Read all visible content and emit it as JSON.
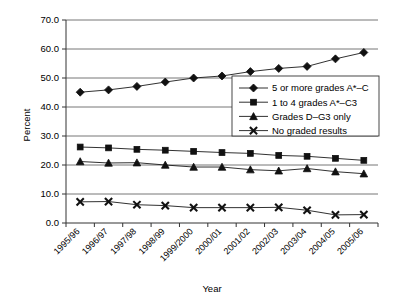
{
  "chart_data": {
    "type": "line",
    "title": "",
    "xlabel": "Year",
    "ylabel": "Percent",
    "ylim": [
      0,
      70
    ],
    "ytick_step": 10,
    "ytick_labels": [
      "0.0",
      "10.0",
      "20.0",
      "30.0",
      "40.0",
      "50.0",
      "60.0",
      "70.0"
    ],
    "grid": true,
    "legend_position": "center-right",
    "categories": [
      "1995/96",
      "1996/97",
      "1997/98",
      "1998/99",
      "1999/2000",
      "2000/01",
      "2001/02",
      "2002/03",
      "2003/04",
      "2004/05",
      "2005/06"
    ],
    "series": [
      {
        "name": "5 or more grades A*–C",
        "marker": "diamond",
        "values": [
          45.1,
          45.9,
          47.1,
          48.6,
          50.0,
          50.7,
          52.2,
          53.3,
          54.0,
          56.6,
          58.8
        ]
      },
      {
        "name": "1 to 4 grades A*–C3",
        "marker": "square",
        "values": [
          26.2,
          25.9,
          25.4,
          25.1,
          24.7,
          24.3,
          24.0,
          23.3,
          23.0,
          22.3,
          21.6
        ]
      },
      {
        "name": "Grades D–G3 only",
        "marker": "triangle",
        "values": [
          21.2,
          20.7,
          20.8,
          20.0,
          19.3,
          19.3,
          18.4,
          18.0,
          18.8,
          17.7,
          17.0
        ]
      },
      {
        "name": "No graded results",
        "marker": "cross",
        "values": [
          7.3,
          7.4,
          6.3,
          6.0,
          5.3,
          5.3,
          5.3,
          5.4,
          4.4,
          2.8,
          2.9
        ]
      }
    ]
  },
  "legend": {
    "items": [
      {
        "label": "5 or more grades A*–C"
      },
      {
        "label": "1 to 4 grades A*–C3"
      },
      {
        "label": "Grades D–G3 only"
      },
      {
        "label": "No graded results"
      }
    ]
  },
  "colors": {
    "line": "#1a1a1a",
    "grid": "#666666",
    "axis": "#333333",
    "background": "#ffffff"
  }
}
